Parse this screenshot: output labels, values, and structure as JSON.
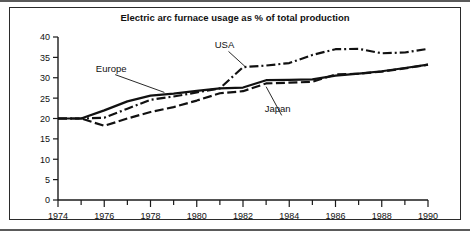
{
  "chart_data": {
    "type": "line",
    "title": "Electric arc furnace usage as % of total production",
    "xlabel": "",
    "ylabel": "",
    "xlim": [
      1974,
      1990
    ],
    "ylim": [
      0,
      40
    ],
    "grid": false,
    "legend_position": "inline-annotations",
    "x": [
      1974,
      1975,
      1976,
      1977,
      1978,
      1979,
      1980,
      1981,
      1982,
      1983,
      1984,
      1985,
      1986,
      1987,
      1988,
      1989,
      1990
    ],
    "x_tick_labels": [
      "1974",
      "1976",
      "1978",
      "1980",
      "1982",
      "1984",
      "1986",
      "1988",
      "1990"
    ],
    "x_tick_values": [
      1974,
      1976,
      1978,
      1980,
      1982,
      1984,
      1986,
      1988,
      1990
    ],
    "x_minor_ticks": [
      1975,
      1977,
      1979,
      1981,
      1983,
      1985,
      1987,
      1989
    ],
    "y_tick_labels": [
      "0",
      "5",
      "10",
      "15",
      "20",
      "25",
      "30",
      "35",
      "40"
    ],
    "y_tick_values": [
      0,
      5,
      10,
      15,
      20,
      25,
      30,
      35,
      40
    ],
    "series": [
      {
        "name": "Europe",
        "line_style": "solid",
        "label_x": 1976.3,
        "label_y": 31.5,
        "leader_to_x": 1978.6,
        "leader_to_y": 26.4,
        "values": [
          20.0,
          20.0,
          22.0,
          24.2,
          25.6,
          26.1,
          26.8,
          27.4,
          27.6,
          29.4,
          29.5,
          29.6,
          30.5,
          31.0,
          31.6,
          32.4,
          33.2
        ]
      },
      {
        "name": "USA",
        "line_style": "dash-dot",
        "label_x": 1981.2,
        "label_y": 37.2,
        "leader_to_x": 1982.1,
        "leader_to_y": 32.7,
        "values": [
          20.0,
          20.0,
          20.2,
          22.4,
          24.6,
          25.4,
          26.4,
          27.4,
          32.6,
          33.0,
          33.6,
          35.6,
          37.0,
          37.1,
          36.0,
          36.2,
          37.1
        ]
      },
      {
        "name": "Japan",
        "line_style": "dashed",
        "label_x": 1983.5,
        "label_y": 21.5,
        "leader_to_x": 1983.0,
        "leader_to_y": 27.8,
        "values": [
          20.0,
          20.0,
          18.2,
          20.0,
          21.6,
          22.8,
          24.4,
          26.2,
          26.7,
          28.6,
          28.8,
          29.0,
          30.8,
          31.0,
          31.5,
          32.3,
          33.2
        ]
      }
    ]
  }
}
